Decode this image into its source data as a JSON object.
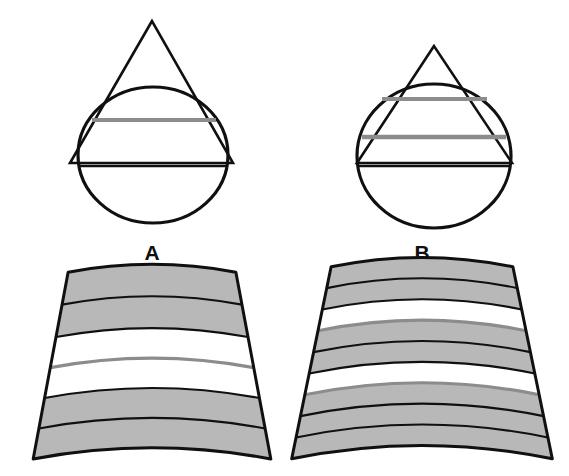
{
  "figure": {
    "background_color": "#ffffff",
    "outline_color": "#101010",
    "gray_band_color": "#b8b8b8",
    "gray_line_color": "#8c8c8c",
    "white_band_color": "#ffffff",
    "panels": [
      {
        "id": "A",
        "label": "A",
        "label_x": 152,
        "label_y": 260,
        "geometry": {
          "triangle": {
            "apex_x": 152,
            "apex_y": 21,
            "base_left_x": 70,
            "base_left_y": 163,
            "base_right_x": 233,
            "base_right_y": 163,
            "stroke_width": 2.6
          },
          "circle": {
            "center_x": 153,
            "center_y": 155,
            "radius_x": 75,
            "radius_y": 68,
            "stroke_width": 3.2
          },
          "chords": [
            {
              "y": 120,
              "x1": 92,
              "x2": 216,
              "color": "#8c8c8c",
              "width": 4.2
            }
          ]
        },
        "sector": {
          "apex_x": 152,
          "apex_y": -176,
          "inner_radius": 456,
          "outer_radius": 646,
          "half_angle_deg": 10.6,
          "bands": [
            {
              "index": 1,
              "fill": "#b8b8b8",
              "thickness": 33
            },
            {
              "index": 2,
              "fill": "#b8b8b8",
              "thickness": 33
            },
            {
              "index": 3,
              "fill": "#ffffff",
              "thickness": 31
            },
            {
              "index": 4,
              "fill": "#ffffff",
              "thickness": 31
            },
            {
              "index": 5,
              "fill": "#b8b8b8",
              "thickness": 31
            },
            {
              "index": 6,
              "fill": "#b8b8b8",
              "thickness": 31
            }
          ],
          "band_count": 6,
          "gray_divider_index": 3
        }
      },
      {
        "id": "B",
        "label": "B",
        "label_x": 422,
        "label_y": 260,
        "geometry": {
          "triangle": {
            "apex_x": 434,
            "apex_y": 46,
            "base_left_x": 357,
            "base_left_y": 163,
            "base_right_x": 512,
            "base_right_y": 163,
            "stroke_width": 2.6
          },
          "circle": {
            "center_x": 434,
            "center_y": 156,
            "radius_x": 77,
            "radius_y": 72,
            "stroke_width": 3.2
          },
          "chords": [
            {
              "y": 99,
              "x1": 382,
              "x2": 487,
              "color": "#8c8c8c",
              "width": 4.2
            },
            {
              "y": 137,
              "x1": 362,
              "x2": 506,
              "color": "#8c8c8c",
              "width": 4.6
            }
          ]
        },
        "sector": {
          "apex_x": 422,
          "apex_y": -176,
          "inner_radius": 452,
          "outer_radius": 648,
          "half_angle_deg": 11.6,
          "bands": [
            {
              "index": 1,
              "fill": "#b8b8b8",
              "thickness": 22
            },
            {
              "index": 2,
              "fill": "#b8b8b8",
              "thickness": 22
            },
            {
              "index": 3,
              "fill": "#ffffff",
              "thickness": 22
            },
            {
              "index": 4,
              "fill": "#b8b8b8",
              "thickness": 22
            },
            {
              "index": 5,
              "fill": "#b8b8b8",
              "thickness": 22
            },
            {
              "index": 6,
              "fill": "#ffffff",
              "thickness": 22
            },
            {
              "index": 7,
              "fill": "#b8b8b8",
              "thickness": 22
            },
            {
              "index": 8,
              "fill": "#b8b8b8",
              "thickness": 22
            },
            {
              "index": 9,
              "fill": "#b8b8b8",
              "thickness": 22
            }
          ],
          "band_count": 9,
          "gray_divider_indices": [
            3,
            6
          ]
        }
      }
    ]
  }
}
